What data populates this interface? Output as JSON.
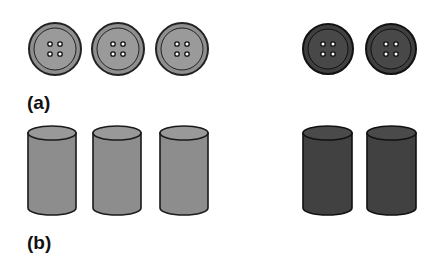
{
  "figure": {
    "panels": [
      {
        "id": "a",
        "label": "(a)",
        "object_type": "button",
        "groups": [
          {
            "name": "light-group",
            "count": 3,
            "fill": "#8f8f8f",
            "inner_fill": "#9a9a9a",
            "stroke": "#222222",
            "centers_x": [
              55,
              118,
              182
            ],
            "center_y": 49,
            "radius": 26
          },
          {
            "name": "dark-group",
            "count": 2,
            "fill": "#404040",
            "inner_fill": "#484848",
            "stroke": "#111111",
            "centers_x": [
              328,
              391
            ],
            "center_y": 49,
            "radius": 25
          }
        ]
      },
      {
        "id": "b",
        "label": "(b)",
        "object_type": "cylinder",
        "groups": [
          {
            "name": "light-group",
            "count": 3,
            "fill": "#8d8d8d",
            "top_fill": "#999999",
            "stroke": "#1a1a1a",
            "lefts_x": [
              28,
              93,
              160
            ],
            "width": 48,
            "top_y": 133,
            "bottom_y": 208,
            "ellipse_ry": 7
          },
          {
            "name": "dark-group",
            "count": 2,
            "fill": "#414141",
            "top_fill": "#4a4a4a",
            "stroke": "#111111",
            "lefts_x": [
              303,
              367
            ],
            "width": 49,
            "top_y": 133,
            "bottom_y": 208,
            "ellipse_ry": 7
          }
        ]
      }
    ]
  }
}
